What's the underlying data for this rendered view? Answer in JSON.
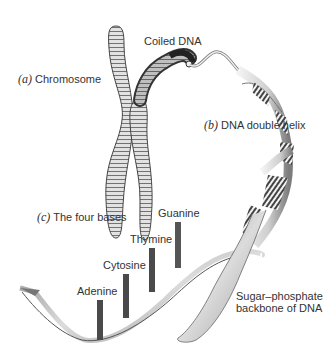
{
  "diagram": {
    "labels": {
      "chromosome": {
        "prefix": "(a)",
        "text": " Chromosome"
      },
      "coiled_dna": {
        "text": "Coiled DNA"
      },
      "double_helix": {
        "prefix": "(b)",
        "text": " DNA double helix"
      },
      "four_bases": {
        "prefix": "(c)",
        "text": " The four bases"
      },
      "adenine": "Adenine",
      "cytosine": "Cytosine",
      "thymine": "Thymine",
      "guanine": "Guanine",
      "backbone_line1": "Sugar–phosphate",
      "backbone_line2": "backbone of DNA"
    },
    "colors": {
      "background": "#ffffff",
      "chromosome_fill": "#d9d9d9",
      "chromosome_stroke": "#555555",
      "coil_dark": "#3a3a3a",
      "ribbon_light": "#e6e6e6",
      "ribbon_dark": "#8a8a8a",
      "base_bar": "#4a4a4a"
    }
  }
}
